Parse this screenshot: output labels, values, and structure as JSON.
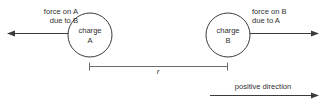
{
  "diagram": {
    "background_color": "#ffffff",
    "line_color": "#3b3b3b",
    "dim_line_color": "#6b6b6b",
    "text_color": "#2f2f2f",
    "charges": [
      {
        "id": "A",
        "label_line1": "charge",
        "label_line2": "A",
        "center_x": 90,
        "center_y": 35,
        "radius": 22
      },
      {
        "id": "B",
        "label_line1": "charge",
        "label_line2": "B",
        "center_x": 228,
        "center_y": 35,
        "radius": 22
      }
    ],
    "forces": [
      {
        "id": "force-on-a",
        "label_line1": "force on A",
        "label_line2": "due to B",
        "direction": "left",
        "tail_x": 70,
        "tip_x": 8,
        "y": 33
      },
      {
        "id": "force-on-b",
        "label_line1": "force on B",
        "label_line2": "due to A",
        "direction": "right",
        "tail_x": 250,
        "tip_x": 318,
        "y": 33
      }
    ],
    "separation": {
      "symbol": "r",
      "line_y": 66,
      "start_x": 89,
      "end_x": 228
    },
    "axis": {
      "label": "positive direction",
      "direction": "right",
      "line_y": 95,
      "tail_x": 210,
      "tip_x": 318
    }
  }
}
